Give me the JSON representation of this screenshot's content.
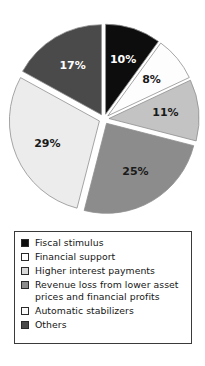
{
  "chart_data": {
    "type": "pie",
    "title": "",
    "subtitle": "",
    "xlabel": "",
    "ylabel": "",
    "grid": false,
    "legend_position": "bottom",
    "units": "percent",
    "exploded": true,
    "start_angle_deg": 0,
    "direction": "clockwise",
    "categories": [
      "Fiscal stimulus",
      "Financial support",
      "Higher interest payments",
      "Revenue loss from lower asset prices and financial profits",
      "Automatic stabilizers",
      "Others"
    ],
    "values": [
      10,
      8,
      11,
      25,
      29,
      17
    ],
    "data_labels": [
      "10%",
      "8%",
      "11%",
      "25%",
      "29%",
      "17%"
    ],
    "colors": [
      "#0d0d0d",
      "#fdfdfd",
      "#c3c3c3",
      "#8c8c8c",
      "#ececec",
      "#4a4a4a"
    ],
    "label_text_colors": [
      "#ffffff",
      "#1a1a1a",
      "#1a1a1a",
      "#1a1a1a",
      "#1a1a1a",
      "#ffffff"
    ],
    "slices": [
      {
        "label": "Fiscal stimulus",
        "value": 10,
        "data_label": "10%",
        "color": "#0d0d0d"
      },
      {
        "label": "Financial support",
        "value": 8,
        "data_label": "8%",
        "color": "#fdfdfd"
      },
      {
        "label": "Higher interest payments",
        "value": 11,
        "data_label": "11%",
        "color": "#c3c3c3"
      },
      {
        "label": "Revenue loss from lower asset prices and financial profits",
        "value": 25,
        "data_label": "25%",
        "color": "#8c8c8c"
      },
      {
        "label": "Automatic stabilizers",
        "value": 29,
        "data_label": "29%",
        "color": "#ececec"
      },
      {
        "label": "Others",
        "value": 17,
        "data_label": "17%",
        "color": "#4a4a4a"
      }
    ]
  },
  "legend": {
    "items": [
      {
        "label": "Fiscal stimulus",
        "color": "#0d0d0d"
      },
      {
        "label": "Financial support",
        "color": "#ffffff"
      },
      {
        "label": "Higher interest payments",
        "color": "#d8d8d8"
      },
      {
        "label": "Revenue loss from lower asset\nprices and financial profits",
        "color": "#8c8c8c"
      },
      {
        "label": "Automatic stabilizers",
        "color": "#fafafa"
      },
      {
        "label": "Others",
        "color": "#4a4a4a"
      }
    ]
  }
}
